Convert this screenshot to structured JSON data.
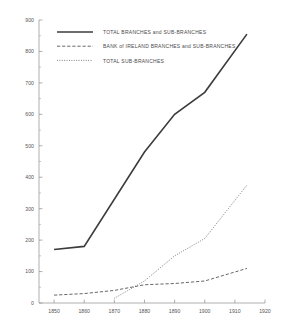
{
  "chart_data": {
    "type": "line",
    "title": "",
    "xlabel": "",
    "ylabel": "",
    "xlim": [
      1845,
      1920
    ],
    "ylim": [
      0,
      900
    ],
    "xticks": [
      1850,
      1860,
      1870,
      1880,
      1890,
      1900,
      1910,
      1920
    ],
    "xtick_labels": [
      "1850",
      "1860",
      "1870",
      "1880",
      "1890",
      "1900",
      "1910",
      "1920"
    ],
    "yticks": [
      0,
      100,
      200,
      300,
      400,
      500,
      600,
      700,
      800,
      900
    ],
    "ytick_labels": [
      "0",
      "100",
      "200",
      "300",
      "400",
      "500",
      "600",
      "700",
      "800",
      "900"
    ],
    "y_minor_ticks": [
      50,
      150,
      250,
      350,
      450,
      550,
      650,
      750,
      850
    ],
    "grid": false,
    "legend_position": "top-left",
    "series": [
      {
        "name": "TOTAL BRANCHES and SUB-BRANCHES",
        "style": "solid",
        "color": "#3c3c3c",
        "x": [
          1850,
          1860,
          1880,
          1890,
          1900,
          1914
        ],
        "values": [
          170,
          180,
          480,
          600,
          670,
          855
        ]
      },
      {
        "name": "BANK of IRELAND BRANCHES and SUB-BRANCHES",
        "style": "dashed",
        "color": "#4b4b4b",
        "x": [
          1850,
          1860,
          1870,
          1880,
          1890,
          1900,
          1914
        ],
        "values": [
          25,
          30,
          40,
          58,
          62,
          70,
          110
        ]
      },
      {
        "name": "TOTAL SUB-BRANCHES",
        "style": "dotted",
        "color": "#5a5a5a",
        "x": [
          1870,
          1880,
          1890,
          1900,
          1914
        ],
        "values": [
          15,
          70,
          150,
          205,
          375
        ]
      }
    ]
  },
  "legend": {
    "entries": [
      {
        "label": "TOTAL BRANCHES and SUB-BRANCHES",
        "style": "solid"
      },
      {
        "label": "BANK of IRELAND BRANCHES and SUB-BRANCHES",
        "style": "dashed"
      },
      {
        "label": "TOTAL SUB-BRANCHES",
        "style": "dotted"
      }
    ]
  }
}
